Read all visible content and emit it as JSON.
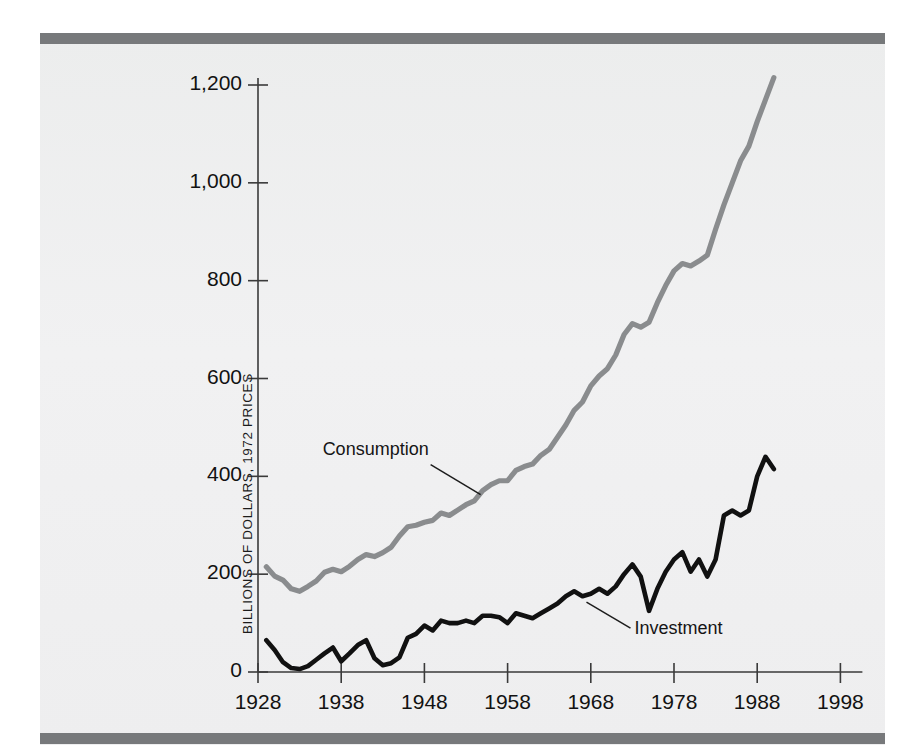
{
  "figure": {
    "background_color": "#eeeff0",
    "rule_color": "#77797b",
    "page_color": "#ffffff"
  },
  "axis": {
    "y_title": "BILLIONS OF DOLLARS, 1972 PRICES",
    "y_ticks": [
      "1,200",
      "1,000",
      "800",
      "600",
      "400",
      "200",
      "0"
    ],
    "y_tick_values": [
      1200,
      1000,
      800,
      600,
      400,
      200,
      0
    ],
    "x_ticks": [
      "1928",
      "1938",
      "1948",
      "1958",
      "1968",
      "1978",
      "1988",
      "1998"
    ],
    "x_tick_values": [
      1928,
      1938,
      1948,
      1958,
      1968,
      1978,
      1988,
      1998
    ]
  },
  "labels": {
    "consumption": "Consumption",
    "investment": "Investment"
  },
  "chart_data": {
    "type": "line",
    "title": "",
    "subtitle": "",
    "xlabel": "",
    "ylabel": "BILLIONS OF DOLLARS, 1972 PRICES",
    "xlim": [
      1928,
      1998
    ],
    "ylim": [
      0,
      1260
    ],
    "grid": false,
    "legend_position": "inline-annotation",
    "colors": {
      "Consumption": "#8a8c8e",
      "Investment": "#111111"
    },
    "x": [
      1929,
      1930,
      1931,
      1932,
      1933,
      1934,
      1935,
      1936,
      1937,
      1938,
      1939,
      1940,
      1941,
      1942,
      1943,
      1944,
      1945,
      1946,
      1947,
      1948,
      1949,
      1950,
      1951,
      1952,
      1953,
      1954,
      1955,
      1956,
      1957,
      1958,
      1959,
      1960,
      1961,
      1962,
      1963,
      1964,
      1965,
      1966,
      1967,
      1968,
      1969,
      1970,
      1971,
      1972,
      1973,
      1974,
      1975,
      1976,
      1977,
      1978,
      1979,
      1980,
      1981,
      1982,
      1983,
      1984,
      1985,
      1986,
      1987,
      1988,
      1989,
      1990
    ],
    "series": [
      {
        "name": "Consumption",
        "values": [
          215,
          196,
          188,
          170,
          165,
          175,
          186,
          204,
          210,
          205,
          216,
          230,
          240,
          236,
          244,
          255,
          278,
          297,
          300,
          306,
          310,
          325,
          320,
          331,
          342,
          350,
          371,
          383,
          391,
          391,
          412,
          420,
          425,
          443,
          455,
          480,
          505,
          535,
          552,
          585,
          605,
          620,
          648,
          690,
          712,
          705,
          715,
          755,
          790,
          820,
          835,
          830,
          840,
          852,
          905,
          955,
          1000,
          1045,
          1075,
          1125,
          1170,
          1215
        ]
      },
      {
        "name": "Investment",
        "values": [
          65,
          45,
          20,
          8,
          6,
          12,
          25,
          38,
          50,
          22,
          38,
          55,
          65,
          28,
          14,
          18,
          30,
          70,
          78,
          95,
          85,
          105,
          100,
          100,
          105,
          100,
          115,
          115,
          112,
          100,
          120,
          115,
          110,
          120,
          130,
          140,
          155,
          165,
          155,
          160,
          170,
          160,
          175,
          200,
          220,
          195,
          125,
          170,
          205,
          230,
          245,
          205,
          230,
          195,
          230,
          320,
          330,
          320,
          330,
          400,
          440,
          415
        ]
      }
    ],
    "annotations": [
      {
        "text": "Consumption",
        "points_to_year": 1955,
        "points_to_value": 371
      },
      {
        "text": "Investment",
        "points_to_year": 1967,
        "points_to_value": 155
      }
    ]
  }
}
